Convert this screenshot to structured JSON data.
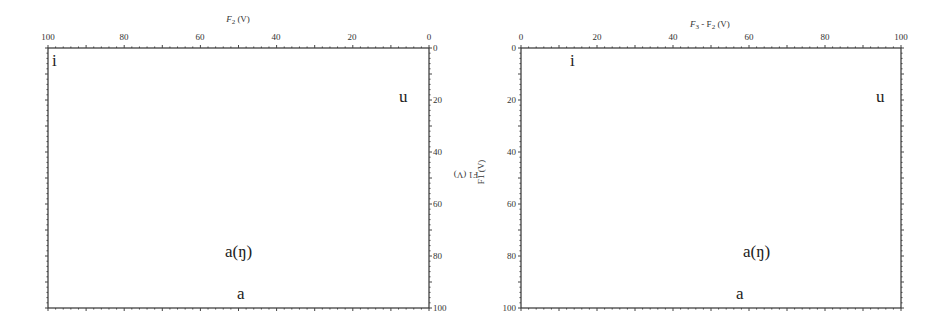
{
  "chart_data": [
    {
      "type": "scatter",
      "title": "",
      "xlabel": "F2 (V)",
      "ylabel": "F1 (V)",
      "xlim": [
        100,
        0
      ],
      "ylim": [
        0,
        100
      ],
      "x_reversed": true,
      "y_reversed": true,
      "x_ticks": [
        "100",
        "80",
        "60",
        "40",
        "20",
        "0"
      ],
      "y_ticks": [
        "0",
        "20",
        "40",
        "60",
        "80",
        "100"
      ],
      "points": [
        {
          "label": "i",
          "x": 97,
          "y": 4
        },
        {
          "label": "u",
          "x": 6,
          "y": 20
        },
        {
          "label": "a(ŋ)",
          "x": 50,
          "y": 78
        },
        {
          "label": "a",
          "x": 50,
          "y": 95
        }
      ]
    },
    {
      "type": "scatter",
      "title": "",
      "xlabel": "F3 - F2 (V)",
      "ylabel": "F1 (V)",
      "xlim": [
        0,
        100
      ],
      "ylim": [
        0,
        100
      ],
      "y_reversed": true,
      "x_ticks": [
        "0",
        "20",
        "40",
        "60",
        "80",
        "100"
      ],
      "y_ticks": [
        "0",
        "20",
        "40",
        "60",
        "80",
        "100"
      ],
      "points": [
        {
          "label": "i",
          "x": 14,
          "y": 4
        },
        {
          "label": "u",
          "x": 95,
          "y": 20
        },
        {
          "label": "a(ŋ)",
          "x": 59,
          "y": 78
        },
        {
          "label": "a",
          "x": 58,
          "y": 95
        }
      ]
    }
  ],
  "left": {
    "xlabel_main": "F",
    "xlabel_sub": "2",
    "xlabel_unit": " (V)",
    "x_ticks": [
      "100",
      "80",
      "60",
      "40",
      "20",
      "0"
    ],
    "y_ticks": [
      "0",
      "20",
      "40",
      "60",
      "80",
      "100"
    ],
    "ylabel": "F1 (V)",
    "labels": [
      "i",
      "u",
      "a(ŋ)",
      "a"
    ]
  },
  "right": {
    "xlabel_main": "F",
    "xlabel_sub": "3",
    "xlabel_rest": " - F",
    "xlabel_sub2": "2",
    "xlabel_unit": " (V)",
    "x_ticks": [
      "0",
      "20",
      "40",
      "60",
      "80",
      "100"
    ],
    "y_ticks": [
      "0",
      "20",
      "40",
      "60",
      "80",
      "100"
    ],
    "ylabel": "F1 (V)",
    "labels": [
      "i",
      "u",
      "a(ŋ)",
      "a"
    ]
  }
}
